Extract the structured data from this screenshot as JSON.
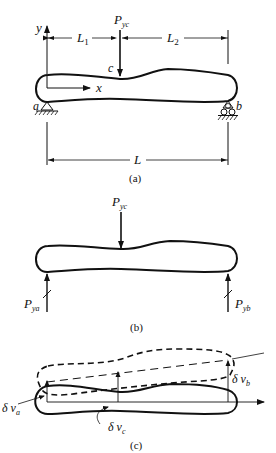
{
  "figure": {
    "panel_a": {
      "caption": "(a)",
      "labels": {
        "y_axis": "y",
        "x_axis": "x",
        "load": "P",
        "load_sub": "yc",
        "point_c": "c",
        "point_a": "a",
        "point_b": "b",
        "L1": "L",
        "L1_sub": "1",
        "L2": "L",
        "L2_sub": "2",
        "L": "L"
      },
      "supports": {
        "a": "pin",
        "b": "roller"
      }
    },
    "panel_b": {
      "caption": "(b)",
      "labels": {
        "load": "P",
        "load_sub": "yc",
        "reaction_a": "P",
        "reaction_a_sub": "ya",
        "reaction_b": "P",
        "reaction_b_sub": "yb"
      }
    },
    "panel_c": {
      "caption": "(c)",
      "labels": {
        "dva": "δ v",
        "dva_sub": "a",
        "dvb": "δ v",
        "dvb_sub": "b",
        "dvc": "δ v",
        "dvc_sub": "c"
      }
    }
  },
  "colors": {
    "ink": "#111111",
    "background": "#ffffff"
  }
}
